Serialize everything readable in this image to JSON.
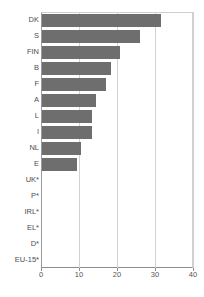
{
  "chart_data": {
    "type": "bar",
    "orientation": "horizontal",
    "title": "",
    "subtitle": "",
    "xlabel": "",
    "ylabel": "",
    "xlim": [
      0,
      40
    ],
    "xticks": [
      0,
      10,
      20,
      30,
      40
    ],
    "xtick_labels": [
      "0",
      "10",
      "20",
      "30",
      "40"
    ],
    "grid": true,
    "grid_axis": "x",
    "legend": false,
    "legend_position": "none",
    "bar_color": "#6e6e6e",
    "axis_color": "#8c8c8c",
    "grid_color": "#d2d2d2",
    "label_color": "#4d4d4d",
    "categories": [
      "DK",
      "S",
      "FIN",
      "B",
      "F",
      "A",
      "L",
      "I",
      "NL",
      "E",
      "UK*",
      "P*",
      "IRL*",
      "EL*",
      "D*",
      "EU-15*"
    ],
    "values": [
      31.3,
      25.8,
      20.5,
      18.2,
      16.8,
      14.2,
      13.2,
      13.2,
      10.2,
      9.2,
      0,
      0,
      0,
      0,
      0,
      0
    ]
  }
}
